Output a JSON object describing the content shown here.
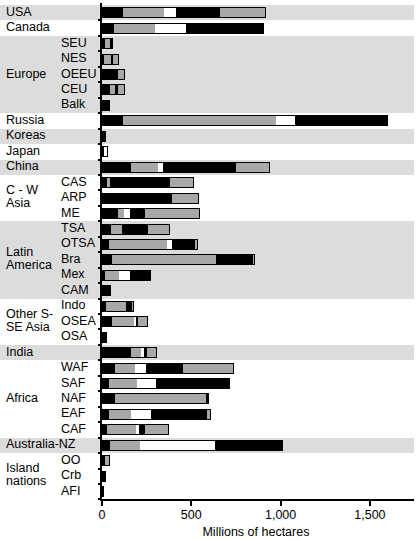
{
  "chart_data": {
    "type": "bar",
    "orientation": "horizontal",
    "title": "",
    "xlabel": "Millions of hectares",
    "ylabel": "",
    "xlim": [
      0,
      1760
    ],
    "xticks": [
      0,
      500,
      1000,
      1500
    ],
    "xticklabels": [
      "0",
      "500",
      "1,000",
      "1,500"
    ],
    "grid": false,
    "legend": false,
    "stacked": true,
    "segment_colors": [
      "#000000",
      "#a8a8a8",
      "#ffffff",
      "#000000",
      "#a8a8a8"
    ],
    "groups": [
      {
        "group": "",
        "shaded": true,
        "rows": [
          {
            "label": "USA",
            "sublabel": "",
            "segments": [
              118,
              230,
              67,
              247,
              258
            ],
            "total": 920
          }
        ]
      },
      {
        "group": "",
        "shaded": false,
        "rows": [
          {
            "label": "Canada",
            "sublabel": "",
            "segments": [
              67,
              230,
              174,
              437,
              0
            ],
            "total": 908
          }
        ]
      },
      {
        "group": "Europe",
        "shaded": true,
        "rows": [
          {
            "label": "",
            "sublabel": "SEU",
            "segments": [
              17,
              28,
              0,
              17,
              0
            ],
            "total": 62
          },
          {
            "label": "",
            "sublabel": "NES",
            "segments": [
              11,
              39,
              0,
              11,
              34
            ],
            "total": 95
          },
          {
            "label": "",
            "sublabel": "OEEU",
            "segments": [
              56,
              0,
              0,
              34,
              39
            ],
            "total": 129
          },
          {
            "label": "",
            "sublabel": "CEU",
            "segments": [
              45,
              28,
              0,
              17,
              39
            ],
            "total": 129
          },
          {
            "label": "",
            "sublabel": "Balk",
            "segments": [
              34,
              0,
              0,
              11,
              0
            ],
            "total": 45
          }
        ]
      },
      {
        "group": "",
        "shaded": false,
        "rows": [
          {
            "label": "Russia",
            "sublabel": "",
            "segments": [
              118,
              857,
              106,
              521,
              0
            ],
            "total": 1602
          }
        ]
      },
      {
        "group": "",
        "shaded": true,
        "rows": [
          {
            "label": "Koreas",
            "sublabel": "",
            "segments": [
              22,
              0,
              0,
              0,
              0
            ],
            "total": 22
          }
        ]
      },
      {
        "group": "",
        "shaded": false,
        "rows": [
          {
            "label": "Japan",
            "sublabel": "",
            "segments": [
              11,
              0,
              22,
              0,
              0
            ],
            "total": 33
          }
        ]
      },
      {
        "group": "",
        "shaded": true,
        "rows": [
          {
            "label": "China",
            "sublabel": "",
            "segments": [
              162,
              151,
              28,
              409,
              190
            ],
            "total": 940
          }
        ]
      },
      {
        "group": "C - W Asia",
        "shaded": false,
        "rows": [
          {
            "label": "",
            "sublabel": "CAS",
            "segments": [
              28,
              17,
              0,
              336,
              134
            ],
            "total": 515
          },
          {
            "label": "",
            "sublabel": "ARP",
            "segments": [
              11,
              0,
              0,
              381,
              151
            ],
            "total": 543
          },
          {
            "label": "",
            "sublabel": "ME",
            "segments": [
              90,
              34,
              34,
              84,
              308
            ],
            "total": 550
          }
        ]
      },
      {
        "group": "Latin America",
        "shaded": true,
        "rows": [
          {
            "label": "",
            "sublabel": "TSA",
            "segments": [
              50,
              62,
              0,
              145,
              123
            ],
            "total": 380
          },
          {
            "label": "",
            "sublabel": "OTSA",
            "segments": [
              39,
              325,
              28,
              129,
              17
            ],
            "total": 538
          },
          {
            "label": "",
            "sublabel": "Bra",
            "segments": [
              56,
              582,
              0,
              207,
              11
            ],
            "total": 856
          },
          {
            "label": "",
            "sublabel": "Mex",
            "segments": [
              17,
              78,
              62,
              118,
              0
            ],
            "total": 275
          },
          {
            "label": "",
            "sublabel": "CAM",
            "segments": [
              34,
              0,
              0,
              17,
              0
            ],
            "total": 51
          }
        ]
      },
      {
        "group": "Other S-SE Asia",
        "shaded": false,
        "rows": [
          {
            "label": "",
            "sublabel": "Indo",
            "segments": [
              22,
              112,
              0,
              34,
              11
            ],
            "total": 179
          },
          {
            "label": "",
            "sublabel": "OSEA",
            "segments": [
              56,
              123,
              11,
              11,
              56
            ],
            "total": 257
          },
          {
            "label": "",
            "sublabel": "OSA",
            "segments": [
              28,
              0,
              0,
              0,
              0
            ],
            "total": 28
          }
        ]
      },
      {
        "group": "",
        "shaded": true,
        "rows": [
          {
            "label": "India",
            "sublabel": "",
            "segments": [
              162,
              56,
              17,
              17,
              56
            ],
            "total": 308
          }
        ]
      },
      {
        "group": "Africa",
        "shaded": false,
        "rows": [
          {
            "label": "",
            "sublabel": "WAF",
            "segments": [
              73,
              112,
              62,
              207,
              286
            ],
            "total": 740
          },
          {
            "label": "",
            "sublabel": "SAF",
            "segments": [
              39,
              157,
              106,
              414,
              0
            ],
            "total": 716
          },
          {
            "label": "",
            "sublabel": "NAF",
            "segments": [
              73,
              510,
              0,
              17,
              0
            ],
            "total": 600
          },
          {
            "label": "",
            "sublabel": "EAF",
            "segments": [
              39,
              123,
              112,
              314,
              22
            ],
            "total": 610
          },
          {
            "label": "",
            "sublabel": "CAF",
            "segments": [
              28,
              162,
              17,
              34,
              134
            ],
            "total": 375
          }
        ]
      },
      {
        "group": "",
        "shaded": true,
        "rows": [
          {
            "label": "Australia-NZ",
            "sublabel": "",
            "segments": [
              45,
              168,
              420,
              381,
              0
            ],
            "total": 1014
          }
        ]
      },
      {
        "group": "Island nations",
        "shaded": false,
        "rows": [
          {
            "label": "",
            "sublabel": "OO",
            "segments": [
              17,
              28,
              0,
              0,
              0
            ],
            "total": 45
          },
          {
            "label": "",
            "sublabel": "Crb",
            "segments": [
              22,
              0,
              0,
              0,
              0
            ],
            "total": 22
          },
          {
            "label": "",
            "sublabel": "AFI",
            "segments": [
              11,
              0,
              0,
              0,
              0
            ],
            "total": 11
          }
        ]
      }
    ]
  }
}
